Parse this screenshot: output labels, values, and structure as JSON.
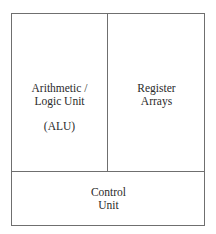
{
  "diagram": {
    "blocks": [
      {
        "id": "alu",
        "label_lines": [
          "Arithmetic /",
          "Logic Unit"
        ],
        "abbreviation": "(ALU)"
      },
      {
        "id": "registers",
        "label_lines": [
          "Register",
          "Arrays"
        ]
      },
      {
        "id": "control",
        "label_lines": [
          "Control",
          "Unit"
        ]
      }
    ],
    "alu": {
      "line1": "Arithmetic /",
      "line2": "Logic Unit",
      "abbr": "(ALU)"
    },
    "registers": {
      "line1": "Register",
      "line2": "Arrays"
    },
    "control": {
      "line1": "Control",
      "line2": "Unit"
    },
    "colors": {
      "border": "#6f6f6f",
      "text": "#2a2a2a",
      "background": "#ffffff"
    }
  }
}
